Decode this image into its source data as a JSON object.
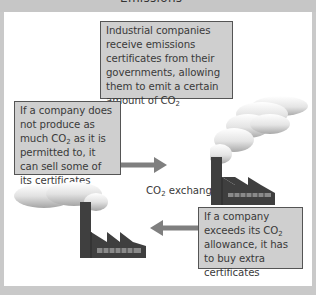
{
  "title": {
    "text": "Emissions trading explained"
  },
  "boxes": {
    "top": {
      "text": "Industrial companies receive emissions certificates from their governments, allowing them to emit a certain amount of",
      "suffix_main": "CO",
      "suffix_sub": "2"
    },
    "left": {
      "line1": "If a company does not produce as much",
      "co": "CO",
      "sub": "2",
      "line2": "as it is permitted to, it can sell some of its certificates"
    },
    "right": {
      "line1": "If a company exceeds its",
      "co": "CO",
      "sub": "2",
      "line2": "allowance, it has to buy extra certificates"
    }
  },
  "market": {
    "co": "CO",
    "sub": "2",
    "label_rest": "exchange market"
  },
  "arrows": [
    {
      "direction": "right",
      "from": "seller-company",
      "to": "market"
    },
    {
      "direction": "left",
      "from": "buyer-company",
      "to": "market"
    }
  ],
  "icons": [
    "factory-icon",
    "smoke-cloud-icon",
    "arrow-right-icon",
    "arrow-left-icon"
  ],
  "colors": {
    "frame": "#c9c9c9",
    "panel": "#ffffff",
    "box_fill": "#cfcfcf",
    "box_border": "#555555",
    "arrow": "#7f7f7f",
    "factory": "#3f3f3f",
    "factory_windows": "#8a8a8a",
    "text": "#3a3a3a"
  }
}
